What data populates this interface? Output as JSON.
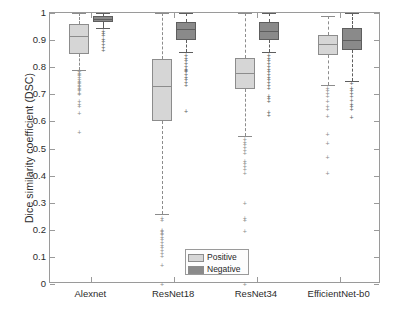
{
  "chart_data": {
    "type": "box",
    "title": "",
    "xlabel": "",
    "ylabel": "Dice similarity coefficient (DSC)",
    "ylim": [
      0,
      1
    ],
    "ytick_labels": [
      "0",
      "0.1",
      "0.2",
      "0.3",
      "0.4",
      "0.5",
      "0.6",
      "0.7",
      "0.8",
      "0.9",
      "1"
    ],
    "ytick_values": [
      0,
      0.1,
      0.2,
      0.3,
      0.4,
      0.5,
      0.6,
      0.7,
      0.8,
      0.9,
      1
    ],
    "grid": false,
    "legend_position": "bottom-center",
    "categories": [
      "Alexnet",
      "ResNet18",
      "ResNet34",
      "EfficientNet-b0"
    ],
    "series": [
      {
        "name": "Positive",
        "color": "#d6d6d6",
        "edge_color": "#8c8c8c",
        "boxes": [
          {
            "category": "Alexnet",
            "q1": 0.85,
            "median": 0.915,
            "q3": 0.96,
            "whisker_low": 0.79,
            "whisker_high": 1.0,
            "outliers": [
              0.785,
              0.78,
              0.775,
              0.77,
              0.765,
              0.755,
              0.75,
              0.745,
              0.74,
              0.735,
              0.73,
              0.725,
              0.72,
              0.715,
              0.705,
              0.7,
              0.675,
              0.665,
              0.655,
              0.63,
              0.56
            ]
          },
          {
            "category": "ResNet18",
            "q1": 0.6,
            "median": 0.73,
            "q3": 0.83,
            "whisker_low": 0.26,
            "whisker_high": 1.0,
            "outliers": [
              0.245,
              0.235,
              0.2,
              0.195,
              0.19,
              0.185,
              0.175,
              0.165,
              0.155,
              0.145,
              0.135,
              0.125,
              0.115,
              0.105,
              0.07,
              0.0
            ]
          },
          {
            "category": "ResNet34",
            "q1": 0.72,
            "median": 0.78,
            "q3": 0.835,
            "whisker_low": 0.545,
            "whisker_high": 1.0,
            "outliers": [
              0.535,
              0.525,
              0.515,
              0.505,
              0.495,
              0.485,
              0.455,
              0.445,
              0.435,
              0.425,
              0.41,
              0.3,
              0.245,
              0.235,
              0.195,
              0.0
            ]
          },
          {
            "category": "EfficientNet-b0",
            "q1": 0.845,
            "median": 0.885,
            "q3": 0.92,
            "whisker_low": 0.735,
            "whisker_high": 0.99,
            "outliers": [
              0.725,
              0.715,
              0.705,
              0.695,
              0.675,
              0.655,
              0.645,
              0.62,
              0.555,
              0.52,
              0.47,
              0.41
            ]
          }
        ]
      },
      {
        "name": "Negative",
        "color": "#8a8a8a",
        "edge_color": "#5e5e5e",
        "boxes": [
          {
            "category": "Alexnet",
            "q1": 0.965,
            "median": 0.978,
            "q3": 0.99,
            "whisker_low": 0.945,
            "whisker_high": 1.0,
            "outliers": [
              0.935,
              0.925,
              0.92,
              0.905,
              0.895,
              0.885,
              0.875,
              0.865
            ]
          },
          {
            "category": "ResNet18",
            "q1": 0.9,
            "median": 0.94,
            "q3": 0.965,
            "whisker_low": 0.855,
            "whisker_high": 1.0,
            "outliers": [
              0.845,
              0.835,
              0.825,
              0.815,
              0.805,
              0.795,
              0.79,
              0.785,
              0.775,
              0.765,
              0.755,
              0.745,
              0.735,
              0.64
            ]
          },
          {
            "category": "ResNet34",
            "q1": 0.9,
            "median": 0.935,
            "q3": 0.965,
            "whisker_low": 0.855,
            "whisker_high": 1.0,
            "outliers": [
              0.845,
              0.835,
              0.825,
              0.815,
              0.805,
              0.795,
              0.785,
              0.775,
              0.765,
              0.755,
              0.745,
              0.735,
              0.725,
              0.695,
              0.685,
              0.675,
              0.635,
              0.625
            ]
          },
          {
            "category": "EfficientNet-b0",
            "q1": 0.865,
            "median": 0.9,
            "q3": 0.945,
            "whisker_low": 0.75,
            "whisker_high": 1.0,
            "outliers": [
              0.74,
              0.725,
              0.715,
              0.705,
              0.695,
              0.68,
              0.665,
              0.655,
              0.645,
              0.615
            ]
          }
        ]
      }
    ]
  },
  "legend": {
    "items": [
      {
        "label": "Positive",
        "color": "#d6d6d6"
      },
      {
        "label": "Negative",
        "color": "#8a8a8a"
      }
    ]
  },
  "axes": {
    "y_label": "Dice similarity coefficient (DSC)",
    "frame_color": "#9a9a9a"
  }
}
